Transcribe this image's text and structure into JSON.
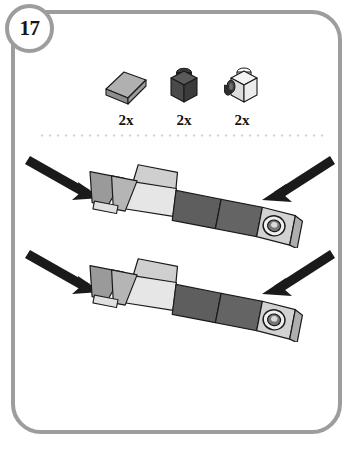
{
  "page": {
    "background_color": "#ffffff",
    "frame_color": "#9d9d9d"
  },
  "step": {
    "number": "17",
    "badge_name": "step-number-badge"
  },
  "parts_inventory": {
    "divider_style": "dotted",
    "items": [
      {
        "name": "slope-brick",
        "description": "Slope brick 33 degrees, medium gray",
        "quantity_label": "2x",
        "color": "#a3a3a3"
      },
      {
        "name": "brick-1x1-dark-gray",
        "description": "Brick 1x1 with top stud, dark gray",
        "quantity_label": "2x",
        "color": "#4e4e4e"
      },
      {
        "name": "headlight-brick-white",
        "description": "Brick 1x1 with stud on side, white",
        "quantity_label": "2x",
        "color": "#f2f2f2"
      }
    ]
  },
  "assemblies": [
    {
      "name": "assembly-illustration-top",
      "description": "Angled sub-assembly with gray slopes, light body, dark gray segments and side-stud end piece",
      "arrows": [
        {
          "name": "placement-arrow-upper-left",
          "direction": "down-right"
        },
        {
          "name": "placement-arrow-upper-right",
          "direction": "down-left"
        }
      ]
    },
    {
      "name": "assembly-illustration-bottom",
      "description": "Second identical angled sub-assembly",
      "arrows": [
        {
          "name": "placement-arrow-lower-left",
          "direction": "down-right"
        },
        {
          "name": "placement-arrow-lower-right",
          "direction": "down-left"
        }
      ]
    }
  ],
  "colors": {
    "outline": "#1a1a1a",
    "slope_gray": "#8f8f8f",
    "light_gray": "#d8d8d8",
    "pale_gray": "#ebebeb",
    "dark_gray": "#5e5e5e",
    "arrow_black": "#1a1a1a"
  }
}
